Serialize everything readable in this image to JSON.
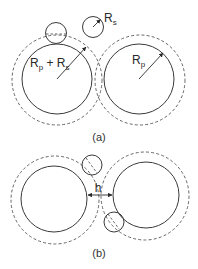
{
  "figure": {
    "panel_a": {
      "caption": "(a)",
      "labels": {
        "left_radius_main": "R",
        "left_radius_sub1": "p",
        "left_radius_plus": " + R",
        "left_radius_sub2": "s",
        "right_radius_main": "R",
        "right_radius_sub": "p",
        "small_radius_main": "R",
        "small_radius_sub": "s"
      }
    },
    "panel_b": {
      "caption": "(b)",
      "labels": {
        "gap": "h"
      }
    },
    "colors": {
      "stroke": "#3a3a3a",
      "dashed": "#555555",
      "background": "#ffffff"
    }
  }
}
